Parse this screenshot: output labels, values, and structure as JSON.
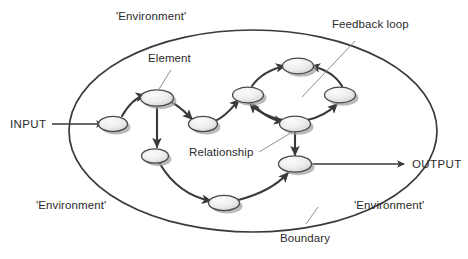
{
  "diagram": {
    "type": "systems-boundary-diagram",
    "colors": {
      "background": "#ffffff",
      "stroke": "#3a3a3a",
      "node_fill_light": "#f2f2f2",
      "node_fill_dark": "#cfcfcf",
      "node_shadow": "#9d9d9d",
      "text": "#2b2b2b",
      "leader_line": "#8a8a8a"
    },
    "labels": {
      "input": "INPUT",
      "output": "OUTPUT",
      "element": "Element",
      "relationship": "Relationship",
      "feedback_loop": "Feedback loop",
      "boundary": "Boundary",
      "environment_top": "'Environment'",
      "environment_bottom_left": "'Environment'",
      "environment_bottom_right": "'Environment'"
    },
    "boundary": {
      "shape": "ellipse",
      "cx": 253,
      "cy": 131,
      "rx": 184,
      "ry": 101
    },
    "nodes": [
      {
        "id": "n1",
        "name": "input-element",
        "cx": 113,
        "cy": 124
      },
      {
        "id": "n2",
        "name": "element-top-left",
        "cx": 157,
        "cy": 98
      },
      {
        "id": "n3",
        "name": "element-mid",
        "cx": 203,
        "cy": 124
      },
      {
        "id": "n4",
        "name": "element-lower-left",
        "cx": 155,
        "cy": 156
      },
      {
        "id": "n5",
        "name": "element-bottom",
        "cx": 224,
        "cy": 203
      },
      {
        "id": "n6",
        "name": "loop-node-left",
        "cx": 248,
        "cy": 95
      },
      {
        "id": "n7",
        "name": "loop-node-top",
        "cx": 298,
        "cy": 66
      },
      {
        "id": "n8",
        "name": "loop-node-right",
        "cx": 340,
        "cy": 95
      },
      {
        "id": "n9",
        "name": "loop-node-bottom",
        "cx": 295,
        "cy": 124
      },
      {
        "id": "n10",
        "name": "output-element",
        "cx": 295,
        "cy": 164
      }
    ],
    "edges": [
      {
        "from": "n1",
        "to": "n2",
        "kind": "curved"
      },
      {
        "from": "n2",
        "to": "n3",
        "kind": "curved"
      },
      {
        "from": "n2",
        "to": "n4",
        "kind": "straight"
      },
      {
        "from": "n3",
        "to": "n6",
        "kind": "curved"
      },
      {
        "from": "n4",
        "to": "n5",
        "kind": "curved"
      },
      {
        "from": "n5",
        "to": "n10",
        "kind": "curved"
      },
      {
        "from": "n6",
        "to": "n7",
        "kind": "curved-loop"
      },
      {
        "from": "n7",
        "to": "n8",
        "kind": "curved-loop"
      },
      {
        "from": "n8",
        "to": "n9",
        "kind": "curved-loop"
      },
      {
        "from": "n9",
        "to": "n6",
        "kind": "curved-loop"
      },
      {
        "from": "n9",
        "to": "n10",
        "kind": "straight"
      }
    ],
    "io_arrows": [
      {
        "name": "input-arrow",
        "x1": 52,
        "y1": 124,
        "x2": 104,
        "y2": 124
      },
      {
        "name": "output-arrow",
        "x1": 305,
        "y1": 164,
        "x2": 405,
        "y2": 164
      }
    ],
    "leaders": [
      {
        "name": "element-leader",
        "x1": 170,
        "y1": 70,
        "x2": 158,
        "y2": 90
      },
      {
        "name": "feedback-loop-leader",
        "x1": 354,
        "y1": 42,
        "x2": 301,
        "y2": 97
      },
      {
        "name": "relationship-leader",
        "x1": 259,
        "y1": 152,
        "x2": 294,
        "y2": 132
      },
      {
        "name": "boundary-leader",
        "x1": 305,
        "y1": 224,
        "x2": 318,
        "y2": 208
      }
    ]
  }
}
